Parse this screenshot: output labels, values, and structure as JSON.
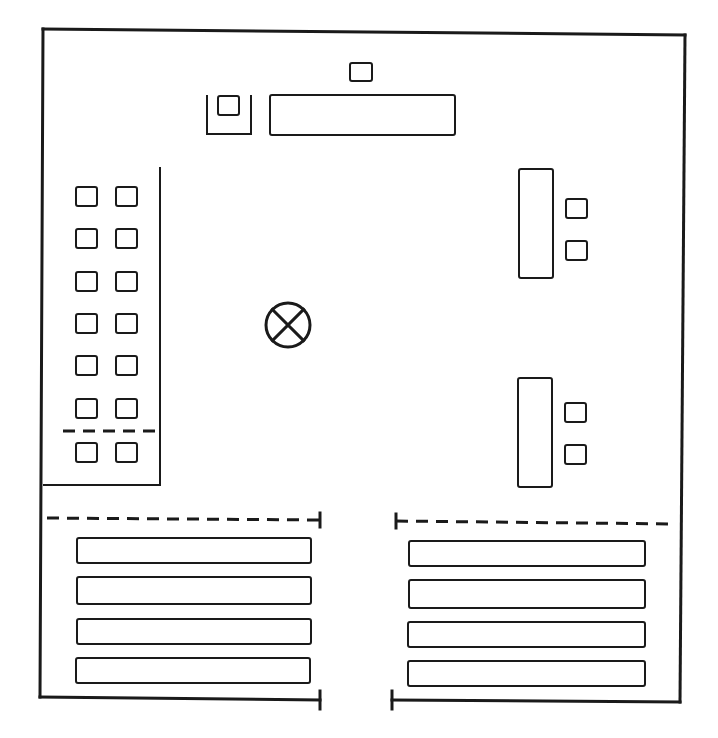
{
  "diagram": {
    "type": "floor-plan",
    "colors": {
      "line": "#1a1a1a",
      "background": "#ffffff"
    },
    "outer_walls": {
      "top": [
        43,
        29,
        685,
        35
      ],
      "left": [
        43,
        29,
        40,
        697
      ],
      "right": [
        685,
        35,
        680,
        702
      ],
      "bottom_left": [
        40,
        697,
        320,
        700
      ],
      "bottom_right": [
        392,
        700,
        680,
        702
      ]
    },
    "top_area": {
      "small_box": {
        "x": 350,
        "y": 63,
        "w": 22,
        "h": 18
      },
      "alcove": {
        "x": 207,
        "y": 95,
        "w": 44,
        "h": 39
      },
      "alcove_box": {
        "x": 218,
        "y": 96,
        "w": 21,
        "h": 19
      },
      "long_table": {
        "x": 270,
        "y": 95,
        "w": 185,
        "h": 40
      }
    },
    "left_enclosure": {
      "x": 43,
      "y": 167,
      "right": 160,
      "bottom": 485,
      "divider_y": 431,
      "seat_grid": {
        "cols": [
          76,
          116
        ],
        "rows": [
          187,
          229,
          272,
          314,
          356,
          399,
          443
        ],
        "size": 21
      }
    },
    "center_symbol": {
      "icon": "circle-x",
      "cx": 288,
      "cy": 325,
      "r": 22
    },
    "right_stations": [
      {
        "table": {
          "x": 519,
          "y": 169,
          "w": 34,
          "h": 109
        },
        "seats": [
          {
            "x": 566,
            "y": 199
          },
          {
            "x": 566,
            "y": 241
          }
        ]
      },
      {
        "table": {
          "x": 518,
          "y": 378,
          "w": 34,
          "h": 109
        },
        "seats": [
          {
            "x": 565,
            "y": 403
          },
          {
            "x": 565,
            "y": 445
          }
        ]
      }
    ],
    "bottom_left_rows": {
      "dash_line": [
        47,
        518,
        320,
        520
      ],
      "benches": [
        {
          "x": 77,
          "y": 538,
          "w": 234,
          "h": 25
        },
        {
          "x": 77,
          "y": 577,
          "w": 234,
          "h": 27
        },
        {
          "x": 77,
          "y": 619,
          "w": 234,
          "h": 25
        },
        {
          "x": 76,
          "y": 658,
          "w": 234,
          "h": 25
        }
      ]
    },
    "bottom_right_rows": {
      "dash_line": [
        396,
        521,
        676,
        524
      ],
      "benches": [
        {
          "x": 409,
          "y": 541,
          "w": 236,
          "h": 25
        },
        {
          "x": 409,
          "y": 580,
          "w": 236,
          "h": 28
        },
        {
          "x": 408,
          "y": 622,
          "w": 237,
          "h": 25
        },
        {
          "x": 408,
          "y": 661,
          "w": 237,
          "h": 25
        }
      ]
    }
  }
}
